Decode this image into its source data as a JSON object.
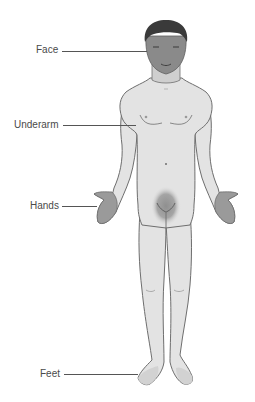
{
  "diagram": {
    "title": "",
    "labels": [
      {
        "id": "face",
        "text": "Face",
        "y": 50
      },
      {
        "id": "underarm",
        "text": "Underarm",
        "y": 125
      },
      {
        "id": "hands",
        "text": "Hands",
        "y": 206
      },
      {
        "id": "feet",
        "text": "Feet",
        "y": 374
      }
    ],
    "colors": {
      "body": "#e3e3e3",
      "outline": "#6e6e6e",
      "highlight": "#9a9a9a",
      "face": "#8a8a8a",
      "hair": "#3a3a3a",
      "label_text": "#4a4a4a"
    }
  }
}
